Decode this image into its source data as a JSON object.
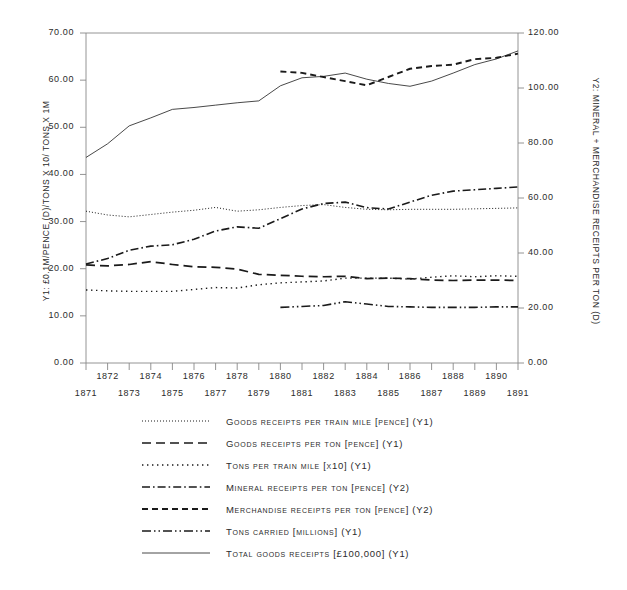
{
  "chart_data": {
    "type": "line",
    "title": "",
    "xlabel": "",
    "ylabel": "Y1: £0.1M/PENCE (D)/TONS X 10/ TONS X 1M",
    "y2label": "Y2: MINERAL + MERCHANDISE RECEIPTS PER TON (D)",
    "grid": false,
    "legend_position": "below",
    "x": [
      1871,
      1872,
      1873,
      1874,
      1875,
      1876,
      1877,
      1878,
      1879,
      1880,
      1881,
      1882,
      1883,
      1884,
      1885,
      1886,
      1887,
      1888,
      1889,
      1890,
      1891
    ],
    "xlim": [
      1871,
      1891
    ],
    "x_tick_labels_upper": [
      "1872",
      "1874",
      "1876",
      "1878",
      "1880",
      "1882",
      "1884",
      "1886",
      "1888",
      "1890"
    ],
    "x_tick_labels_lower": [
      "1871",
      "1873",
      "1875",
      "1877",
      "1879",
      "1881",
      "1883",
      "1885",
      "1887",
      "1889",
      "1891"
    ],
    "y1_ticks": [
      "0.00",
      "10.00",
      "20.00",
      "30.00",
      "40.00",
      "50.00",
      "60.00",
      "70.00"
    ],
    "y1lim": [
      0,
      70
    ],
    "y2_ticks": [
      "0.00",
      "20.00",
      "40.00",
      "60.00",
      "80.00",
      "100.00",
      "120.00"
    ],
    "y2lim": [
      0,
      120
    ],
    "series": [
      {
        "name": "Goods receipts per train mile  [pence] (Y1)",
        "axis": "Y1",
        "style": "dotted-fine",
        "x": [
          1871,
          1872,
          1873,
          1874,
          1875,
          1876,
          1877,
          1878,
          1879,
          1880,
          1881,
          1882,
          1883,
          1884,
          1885,
          1886,
          1887,
          1888,
          1889,
          1890,
          1891
        ],
        "values": [
          32.2,
          31.4,
          31.0,
          31.5,
          32.0,
          32.4,
          33.0,
          32.2,
          32.5,
          33.0,
          33.4,
          33.6,
          33.0,
          32.6,
          32.5,
          32.6,
          32.6,
          32.6,
          32.7,
          32.8,
          32.9
        ]
      },
      {
        "name": "Goods receipts per ton [pence] (Y1)",
        "axis": "Y1",
        "style": "dashed-long",
        "x": [
          1871,
          1872,
          1873,
          1874,
          1875,
          1876,
          1877,
          1878,
          1879,
          1880,
          1881,
          1882,
          1883,
          1884,
          1885,
          1886,
          1887,
          1888,
          1889,
          1890,
          1891
        ],
        "values": [
          20.8,
          20.6,
          20.9,
          21.5,
          20.9,
          20.4,
          20.3,
          19.9,
          18.8,
          18.6,
          18.4,
          18.3,
          18.4,
          17.9,
          18.0,
          17.9,
          17.6,
          17.5,
          17.6,
          17.6,
          17.5
        ]
      },
      {
        "name": "Tons per train mile [x10] (Y1)",
        "axis": "Y1",
        "style": "dotted-sparse",
        "x": [
          1871,
          1872,
          1873,
          1874,
          1875,
          1876,
          1877,
          1878,
          1879,
          1880,
          1881,
          1882,
          1883,
          1884,
          1885,
          1886,
          1887,
          1888,
          1889,
          1890,
          1891
        ],
        "values": [
          15.5,
          15.3,
          15.2,
          15.2,
          15.2,
          15.6,
          16.0,
          15.9,
          16.6,
          17.0,
          17.2,
          17.4,
          18.0,
          18.0,
          18.0,
          17.8,
          18.2,
          18.5,
          18.3,
          18.5,
          18.4
        ]
      },
      {
        "name": "Mineral receipts per ton [pence] (Y2)",
        "axis": "Y2",
        "style": "dash-dot",
        "x": [
          1871,
          1872,
          1873,
          1874,
          1875,
          1876,
          1877,
          1878,
          1879,
          1880,
          1881,
          1882,
          1883,
          1884,
          1885,
          1886,
          1887,
          1888,
          1889,
          1890,
          1891
        ],
        "values": [
          36.0,
          38.0,
          41.0,
          42.5,
          43.0,
          45.0,
          48.0,
          49.5,
          49.0,
          52.5,
          56.0,
          58.0,
          58.5,
          56.5,
          56.0,
          58.5,
          61.0,
          62.5,
          63.0,
          63.5,
          64.0
        ]
      },
      {
        "name": "Merchandise receipts per ton [pence] (Y2)",
        "axis": "Y2",
        "style": "dashed-short",
        "x": [
          1880,
          1881,
          1882,
          1883,
          1884,
          1885,
          1886,
          1887,
          1888,
          1889,
          1890,
          1891
        ],
        "values": [
          106.0,
          105.5,
          104.0,
          102.5,
          101.0,
          104.0,
          107.0,
          108.0,
          108.5,
          110.5,
          111.0,
          112.5
        ]
      },
      {
        "name": "Tons carried [millions] (Y1)",
        "axis": "Y1",
        "style": "dash-dot-dot",
        "x": [
          1880,
          1881,
          1882,
          1883,
          1884,
          1885,
          1886,
          1887,
          1888,
          1889,
          1890,
          1891
        ],
        "values": [
          11.8,
          12.0,
          12.2,
          13.0,
          12.5,
          12.0,
          11.9,
          11.8,
          11.8,
          11.8,
          11.9,
          11.9
        ]
      },
      {
        "name": "Total goods receipts [£100,000] (Y1)",
        "axis": "Y1",
        "style": "solid-thin",
        "x": [
          1871,
          1872,
          1873,
          1874,
          1875,
          1876,
          1877,
          1878,
          1879,
          1880,
          1881,
          1882,
          1883,
          1884,
          1885,
          1886,
          1887,
          1888,
          1889,
          1890,
          1891
        ],
        "values": [
          43.6,
          46.5,
          50.3,
          52.0,
          53.8,
          54.2,
          54.7,
          55.2,
          55.6,
          58.8,
          60.5,
          60.8,
          61.5,
          60.2,
          59.3,
          58.7,
          59.8,
          61.5,
          63.3,
          64.5,
          66.2
        ]
      }
    ]
  },
  "legend": {
    "items": [
      {
        "label": "Goods receipts per train mile  [pence] (Y1)",
        "style": "dotted-fine"
      },
      {
        "label": "Goods receipts per ton [pence] (Y1)",
        "style": "dashed-long"
      },
      {
        "label": "Tons per train mile [x10] (Y1)",
        "style": "dotted-sparse"
      },
      {
        "label": "Mineral receipts per ton [pence] (Y2)",
        "style": "dash-dot"
      },
      {
        "label": "Merchandise receipts per ton [pence] (Y2)",
        "style": "dashed-short"
      },
      {
        "label": "Tons carried [millions] (Y1)",
        "style": "dash-dot-dot"
      },
      {
        "label": "Total goods receipts [£100,000] (Y1)",
        "style": "solid-thin"
      }
    ]
  },
  "colors": {
    "line": "#1a1a1a",
    "axis": "#888888",
    "text": "#2b2b2b",
    "background": "#ffffff"
  }
}
